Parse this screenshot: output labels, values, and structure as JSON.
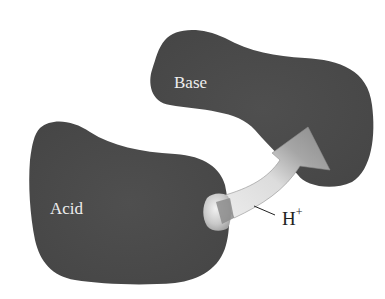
{
  "diagram": {
    "molecules": [
      {
        "id": "base",
        "label": "Base"
      },
      {
        "id": "acid",
        "label": "Acid"
      }
    ],
    "transfer": {
      "label": "H",
      "charge": "+",
      "from": "acid",
      "to": "base"
    },
    "colors": {
      "molecule_fill": "#4a4a4a",
      "arrow_light": "#e6e6e6",
      "arrow_dark": "#8a8a8a",
      "label_light": "#eeeeee",
      "label_dark": "#222222",
      "background": "#ffffff"
    }
  }
}
